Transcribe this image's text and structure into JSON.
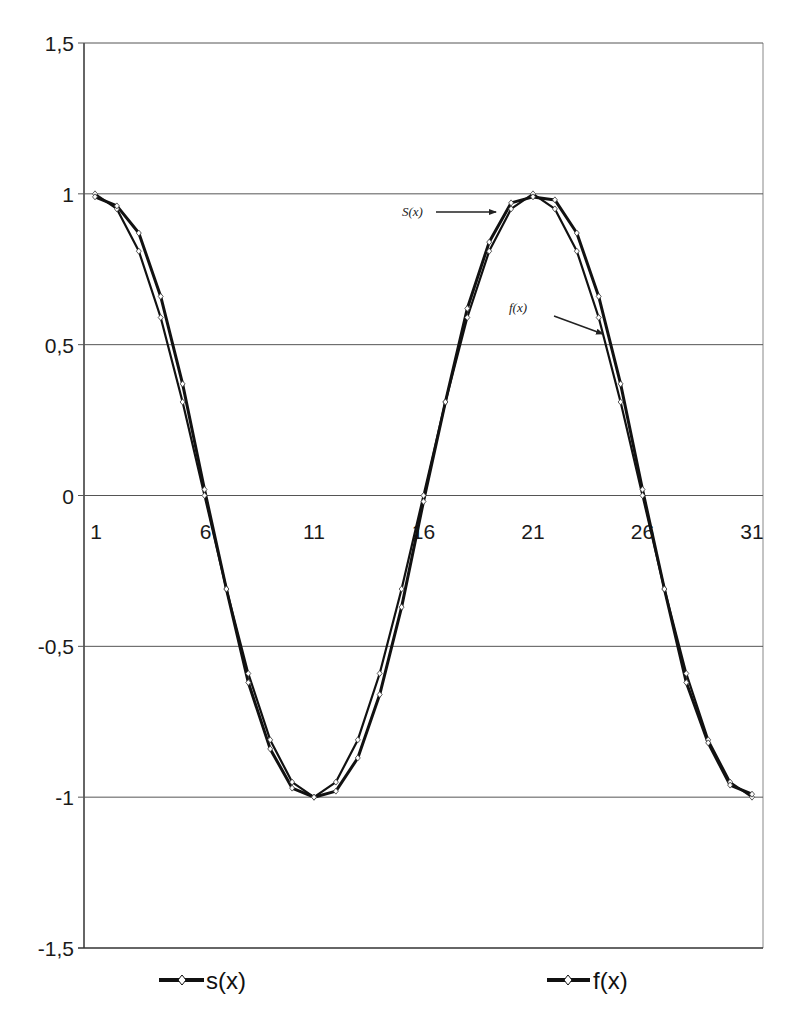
{
  "chart_data": {
    "type": "line",
    "title": "",
    "xlabel": "",
    "ylabel": "",
    "ylim": [
      -1.5,
      1.5
    ],
    "yticks": [
      "1,5",
      "1",
      "0,5",
      "0",
      "-0,5",
      "-1",
      "-1,5"
    ],
    "ytick_values": [
      1.5,
      1,
      0.5,
      0,
      -0.5,
      -1,
      -1.5
    ],
    "xtick_labels": [
      "1",
      "6",
      "11",
      "16",
      "21",
      "26",
      "31"
    ],
    "x": [
      1,
      2,
      3,
      4,
      5,
      6,
      7,
      8,
      9,
      10,
      11,
      12,
      13,
      14,
      15,
      16,
      17,
      18,
      19,
      20,
      21,
      22,
      23,
      24,
      25,
      26,
      27,
      28,
      29,
      30,
      31
    ],
    "grid": "horizontal",
    "legend_position": "bottom",
    "series": [
      {
        "name": "s(x)",
        "values": [
          1,
          0.95,
          0.81,
          0.59,
          0.31,
          0,
          -0.31,
          -0.59,
          -0.81,
          -0.95,
          -1,
          -0.95,
          -0.81,
          -0.59,
          -0.31,
          0,
          0.31,
          0.59,
          0.81,
          0.95,
          1,
          0.95,
          0.81,
          0.59,
          0.31,
          0,
          -0.31,
          -0.59,
          -0.81,
          -0.95,
          -1
        ]
      },
      {
        "name": "f(x)",
        "values": [
          0.99,
          0.96,
          0.87,
          0.66,
          0.37,
          0.02,
          -0.31,
          -0.62,
          -0.84,
          -0.97,
          -1,
          -0.98,
          -0.87,
          -0.66,
          -0.37,
          -0.02,
          0.31,
          0.62,
          0.84,
          0.97,
          0.99,
          0.98,
          0.87,
          0.66,
          0.37,
          0.02,
          -0.31,
          -0.62,
          -0.82,
          -0.96,
          -0.99
        ]
      }
    ],
    "annotations": [
      {
        "text": "S(x)",
        "target_series": "s(x)"
      },
      {
        "text": "f(x)",
        "target_series": "f(x)"
      }
    ]
  },
  "legend": {
    "items": [
      {
        "label": "s(x)"
      },
      {
        "label": "f(x)"
      }
    ]
  }
}
